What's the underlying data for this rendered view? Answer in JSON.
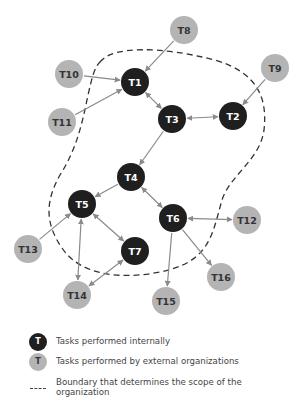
{
  "colors": {
    "internal": "#1f1f1f",
    "external": "#b4b4b4",
    "internal_text": "#ffffff",
    "external_text": "#333333",
    "edge": "#8a8a8a",
    "boundary": "#333333"
  },
  "nodes": [
    {
      "id": "T1",
      "label": "T1",
      "type": "internal",
      "x": 135,
      "y": 82
    },
    {
      "id": "T2",
      "label": "T2",
      "type": "internal",
      "x": 233,
      "y": 116
    },
    {
      "id": "T3",
      "label": "T3",
      "type": "internal",
      "x": 172,
      "y": 119
    },
    {
      "id": "T4",
      "label": "T4",
      "type": "internal",
      "x": 131,
      "y": 177
    },
    {
      "id": "T5",
      "label": "T5",
      "type": "internal",
      "x": 82,
      "y": 204
    },
    {
      "id": "T6",
      "label": "T6",
      "type": "internal",
      "x": 173,
      "y": 218
    },
    {
      "id": "T7",
      "label": "T7",
      "type": "internal",
      "x": 135,
      "y": 251
    },
    {
      "id": "T8",
      "label": "T8",
      "type": "external",
      "x": 184,
      "y": 30
    },
    {
      "id": "T9",
      "label": "T9",
      "type": "external",
      "x": 275,
      "y": 68
    },
    {
      "id": "T10",
      "label": "T10",
      "type": "external",
      "x": 69,
      "y": 74
    },
    {
      "id": "T11",
      "label": "T11",
      "type": "external",
      "x": 62,
      "y": 122
    },
    {
      "id": "T12",
      "label": "T12",
      "type": "external",
      "x": 247,
      "y": 220
    },
    {
      "id": "T13",
      "label": "T13",
      "type": "external",
      "x": 28,
      "y": 249
    },
    {
      "id": "T14",
      "label": "T14",
      "type": "external",
      "x": 77,
      "y": 295
    },
    {
      "id": "T15",
      "label": "T15",
      "type": "external",
      "x": 166,
      "y": 301
    },
    {
      "id": "T16",
      "label": "T16",
      "type": "external",
      "x": 221,
      "y": 277
    }
  ],
  "edges": [
    {
      "from": "T8",
      "to": "T1",
      "dir": "forward"
    },
    {
      "from": "T10",
      "to": "T1",
      "dir": "forward"
    },
    {
      "from": "T11",
      "to": "T1",
      "dir": "forward"
    },
    {
      "from": "T1",
      "to": "T3",
      "dir": "both"
    },
    {
      "from": "T3",
      "to": "T2",
      "dir": "both"
    },
    {
      "from": "T9",
      "to": "T2",
      "dir": "forward"
    },
    {
      "from": "T3",
      "to": "T4",
      "dir": "forward"
    },
    {
      "from": "T4",
      "to": "T5",
      "dir": "forward"
    },
    {
      "from": "T4",
      "to": "T6",
      "dir": "both"
    },
    {
      "from": "T5",
      "to": "T7",
      "dir": "both"
    },
    {
      "from": "T13",
      "to": "T5",
      "dir": "forward"
    },
    {
      "from": "T5",
      "to": "T14",
      "dir": "both"
    },
    {
      "from": "T7",
      "to": "T14",
      "dir": "both"
    },
    {
      "from": "T6",
      "to": "T12",
      "dir": "both"
    },
    {
      "from": "T6",
      "to": "T15",
      "dir": "forward"
    },
    {
      "from": "T6",
      "to": "T16",
      "dir": "forward"
    }
  ],
  "boundary": {
    "path": "M 100 62 C 112 46, 160 46, 215 60 C 255 72, 268 95, 264 130 C 260 160, 230 175, 222 200 C 212 235, 210 262, 160 272 C 120 280, 80 275, 62 248 C 44 222, 46 200, 60 175 C 76 150, 82 125, 88 95 C 92 78, 94 68, 100 62 Z"
  },
  "legend": {
    "symbol_letter": "T",
    "items": [
      {
        "kind": "internal",
        "text": "Tasks performed internally"
      },
      {
        "kind": "external",
        "text": "Tasks performed by external organizations"
      },
      {
        "kind": "boundary",
        "text": "Boundary that determines the scope of the organization"
      }
    ]
  }
}
